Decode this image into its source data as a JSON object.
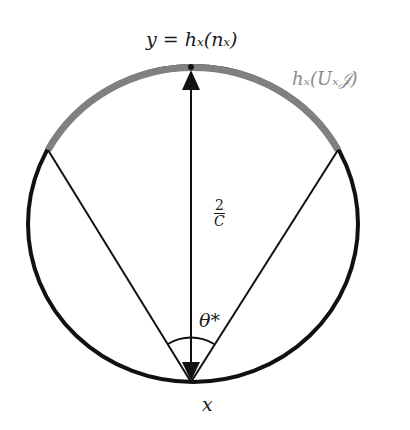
{
  "diagram": {
    "labels": {
      "top": "y = hₓ(nₓ)",
      "arc": "hₓ(Uₓ𝒥)",
      "distance_num": "2",
      "distance_den": "C",
      "angle": "θ*",
      "bottom": "x"
    },
    "colors": {
      "circle": "#111111",
      "arc_highlight": "#808080",
      "text_gray": "#8a8a8a"
    }
  }
}
